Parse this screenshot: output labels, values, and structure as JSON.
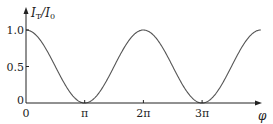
{
  "chart_data": {
    "type": "line",
    "title": "",
    "xlabel": "φ",
    "ylabel": "I_T/I_0",
    "ylabel_parts": {
      "num": "I",
      "num_sub": "T",
      "den": "I",
      "den_sub": "0"
    },
    "x_ticks": [
      {
        "value": 0,
        "label": "0"
      },
      {
        "value": 3.14159,
        "label": "π"
      },
      {
        "value": 6.28319,
        "label": "2π"
      },
      {
        "value": 9.42478,
        "label": "3π"
      }
    ],
    "y_ticks": [
      {
        "value": 0,
        "label": "0"
      },
      {
        "value": 0.5,
        "label": "0.5"
      },
      {
        "value": 1.0,
        "label": "1.0"
      }
    ],
    "xlim": [
      0,
      12.57
    ],
    "ylim": [
      0,
      1.0
    ],
    "grid": false,
    "series": [
      {
        "name": "I_T/I_0 = cos²(φ/2)",
        "function": "cos^2(phi/2)",
        "x": [
          0,
          1.5708,
          3.1416,
          4.7124,
          6.2832,
          7.854,
          9.4248,
          10.9956,
          12.5664
        ],
        "values": [
          1.0,
          0.5,
          0.0,
          0.5,
          1.0,
          0.5,
          0.0,
          0.5,
          1.0
        ]
      }
    ],
    "colors": {
      "curve": "#555555",
      "axis": "#222222"
    }
  }
}
